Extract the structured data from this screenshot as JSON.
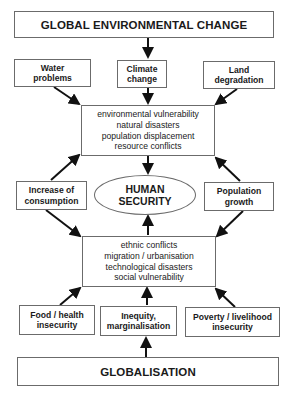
{
  "diagram": {
    "top": {
      "label": "GLOBAL ENVIRONMENTAL CHANGE"
    },
    "environmental_drivers": [
      {
        "line1": "Water",
        "line2": "problems"
      },
      {
        "line1": "Climate",
        "line2": "change"
      },
      {
        "line1": "Land",
        "line2": "degradation"
      }
    ],
    "upper_effects": {
      "lines": [
        "environmental vulnerability",
        "natural disasters",
        "population displacement",
        "resource conflicts"
      ]
    },
    "side_left": {
      "line1": "Increase of",
      "line2": "consumption"
    },
    "center": {
      "line1": "HUMAN",
      "line2": "SECURITY"
    },
    "side_right": {
      "line1": "Population",
      "line2": "growth"
    },
    "lower_effects": {
      "lines": [
        "ethnic conflicts",
        "migration / urbanisation",
        "technological disasters",
        "social vulnerability"
      ]
    },
    "social_drivers": [
      {
        "line1": "Food / health",
        "line2": "insecurity"
      },
      {
        "line1": "Inequity,",
        "line2": "marginalisation"
      },
      {
        "line1": "Poverty / livelihood",
        "line2": "insecurity"
      }
    ],
    "bottom": {
      "label": "GLOBALISATION"
    }
  },
  "colors": {
    "border": "#6b6b6b",
    "arrow": "#111111",
    "text": "#1a1a1a",
    "background": "#ffffff"
  }
}
